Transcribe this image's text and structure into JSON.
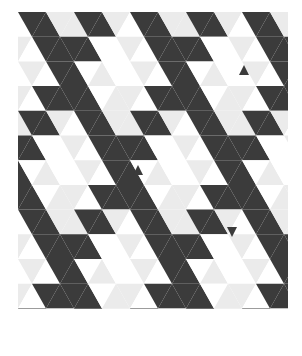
{
  "artwork": {
    "type": "triangle-tessellation",
    "origin": {
      "x": 18,
      "y": 12
    },
    "rows": 12,
    "cols": 19,
    "triangle_width": 28,
    "row_height": 24.7,
    "colors": {
      "dark": "#3b3b3b",
      "light": "#ebebeb",
      "white": "#ffffff"
    },
    "accents": [
      {
        "x": 244,
        "y": 70,
        "size": 10,
        "dir": "up"
      },
      {
        "x": 138,
        "y": 170,
        "size": 10,
        "dir": "up"
      },
      {
        "x": 232,
        "y": 232,
        "size": 10,
        "dir": "down"
      }
    ]
  }
}
